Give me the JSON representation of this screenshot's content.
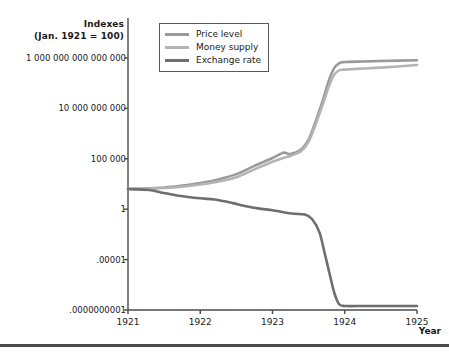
{
  "chart_data": {
    "type": "line",
    "title": "",
    "ylabel_line1": "Indexes",
    "ylabel_line2": "(Jan. 1921 = 100)",
    "xlabel": "Year",
    "grid": false,
    "legend_position": "top-left-inside",
    "yscale": "log",
    "ylim": [
      1e-10,
      1000000000000000.0
    ],
    "xlim": [
      1921,
      1925
    ],
    "y_tick_values": [
      1000000000000000.0,
      10000000000.0,
      100000.0,
      1,
      1e-05,
      1e-10
    ],
    "y_tick_labels": [
      "1 000 000 000 000 000",
      "10 000 000 000",
      "100 000",
      "1",
      ".00001",
      ".0000000001"
    ],
    "x_tick_values": [
      1921,
      1922,
      1923,
      1924,
      1925
    ],
    "x_tick_labels": [
      "1921",
      "1922",
      "1923",
      "1924",
      "1925"
    ],
    "series": [
      {
        "name": "Price level",
        "color": "#9a9a9a",
        "x": [
          1921.0,
          1921.25,
          1921.5,
          1921.75,
          1922.0,
          1922.25,
          1922.5,
          1922.75,
          1923.0,
          1923.15,
          1923.25,
          1923.4,
          1923.5,
          1923.6,
          1923.7,
          1923.78,
          1923.85,
          1923.92,
          1924.0,
          1924.25,
          1924.5,
          1925.0
        ],
        "y": [
          100,
          110,
          140,
          220,
          400,
          900,
          3000,
          20000,
          120000,
          400000,
          300000,
          900000,
          8000000,
          600000000,
          80000000000,
          6000000000000,
          90000000000000,
          300000000000000,
          400000000000000,
          450000000000000,
          500000000000000,
          600000000000000
        ]
      },
      {
        "name": "Money supply",
        "color": "#b4b4b4",
        "x": [
          1921.0,
          1921.25,
          1921.5,
          1921.75,
          1922.0,
          1922.25,
          1922.5,
          1922.75,
          1923.0,
          1923.15,
          1923.25,
          1923.4,
          1923.5,
          1923.6,
          1923.7,
          1923.78,
          1923.85,
          1923.92,
          1924.0,
          1924.25,
          1924.5,
          1925.0
        ],
        "y": [
          100,
          108,
          125,
          170,
          280,
          550,
          1500,
          9000,
          50000,
          120000,
          200000,
          600000,
          5000000,
          300000000,
          30000000000,
          1500000000000,
          20000000000000,
          60000000000000,
          70000000000000,
          90000000000000,
          110000000000000,
          200000000000000
        ]
      },
      {
        "name": "Exchange rate",
        "color": "#6e6e6e",
        "x": [
          1921.0,
          1921.3,
          1921.5,
          1921.7,
          1922.0,
          1922.2,
          1922.45,
          1922.6,
          1922.8,
          1923.0,
          1923.15,
          1923.3,
          1923.45,
          1923.55,
          1923.65,
          1923.72,
          1923.8,
          1923.86,
          1923.92,
          1924.0,
          1924.3,
          1924.7,
          1925.0
        ],
        "y": [
          100,
          80,
          40,
          22,
          12,
          9,
          4,
          2.2,
          1.2,
          0.8,
          0.5,
          0.35,
          0.3,
          0.1,
          0.005,
          5e-05,
          2e-07,
          4e-09,
          4e-10,
          2.5e-10,
          2.5e-10,
          2.5e-10,
          2.5e-10
        ]
      }
    ]
  },
  "legend": {
    "items": [
      {
        "label": "Price level",
        "color": "#9a9a9a"
      },
      {
        "label": "Money supply",
        "color": "#b4b4b4"
      },
      {
        "label": "Exchange rate",
        "color": "#6e6e6e"
      }
    ]
  },
  "axis": {
    "y_title_line1": "Indexes",
    "y_title_line2": "(Jan. 1921 = 100)",
    "x_title": "Year"
  },
  "colors": {
    "axis": "#4a4a4a",
    "text": "#1a1a1a",
    "legend_border": "#5a5a5a",
    "rule": "#4a4a4a"
  }
}
